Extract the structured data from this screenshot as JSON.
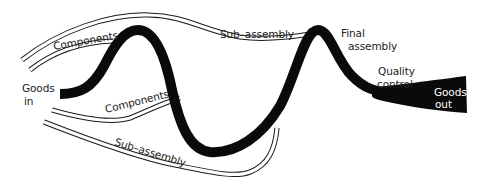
{
  "diagram": {
    "type": "process-flow",
    "colors": {
      "main_flow": "#0a0a0a",
      "feeder_lines": "#1a1a1a",
      "background": "#ffffff",
      "label_text": "#222222",
      "label_on_dark": "#ffffff"
    },
    "labels": {
      "goods_in_line1": "Goods",
      "goods_in_line2": "in",
      "components_top": "Components",
      "components_bottom": "Components",
      "subassembly_top": "Sub–assembly",
      "subassembly_bottom": "Sub–assembly",
      "final_assembly_line1": "Final",
      "final_assembly_line2": "assembly",
      "quality_control_line1": "Quality",
      "quality_control_line2": "control",
      "goods_out_line1": "Goods",
      "goods_out_line2": "out"
    },
    "stages": [
      {
        "id": "goods-in",
        "label": "Goods in"
      },
      {
        "id": "final-assembly",
        "label": "Final assembly"
      },
      {
        "id": "quality-control",
        "label": "Quality control"
      },
      {
        "id": "goods-out",
        "label": "Goods out"
      }
    ],
    "feeders": [
      {
        "id": "components-top",
        "label": "Components"
      },
      {
        "id": "subassembly-top",
        "label": "Sub–assembly"
      },
      {
        "id": "components-bottom",
        "label": "Components"
      },
      {
        "id": "subassembly-bottom",
        "label": "Sub–assembly"
      }
    ]
  }
}
